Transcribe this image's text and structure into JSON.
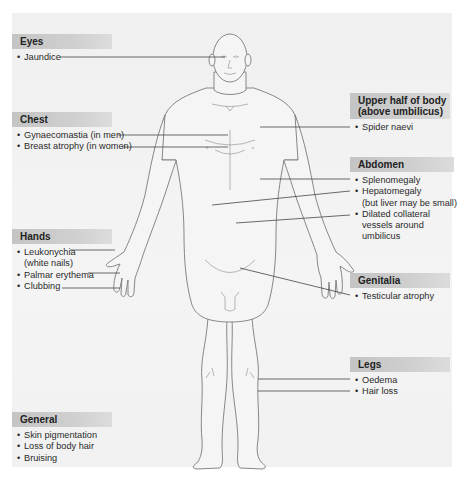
{
  "diagram": {
    "colors": {
      "panel": "#f2f2f2",
      "header_bar": "#c8c8c8",
      "skin": "#f4f4f4",
      "outline": "#777777",
      "leader": "#444444"
    },
    "groups": {
      "eyes": {
        "title": "Eyes",
        "items": [
          {
            "text": "Jaundice"
          }
        ]
      },
      "chest": {
        "title": "Chest",
        "items": [
          {
            "text": "Gynaecomastia (in men)"
          },
          {
            "text": "Breast atrophy (in women)"
          }
        ]
      },
      "hands": {
        "title": "Hands",
        "items": [
          {
            "text": "Leukonychia",
            "sub": "(white nails)"
          },
          {
            "text": "Palmar erythema"
          },
          {
            "text": "Clubbing"
          }
        ]
      },
      "general": {
        "title": "General",
        "items": [
          {
            "text": "Skin pigmentation"
          },
          {
            "text": "Loss of body hair"
          },
          {
            "text": "Bruising"
          }
        ]
      },
      "upper_body": {
        "title_line1": "Upper half of body",
        "title_line2": "(above umbilicus)",
        "items": [
          {
            "text": "Spider naevi"
          }
        ]
      },
      "abdomen": {
        "title": "Abdomen",
        "items": [
          {
            "text": "Splenomegaly"
          },
          {
            "text": "Hepatomegaly",
            "sub": "(but liver may be small)"
          },
          {
            "text": "Dilated collateral",
            "sub": "vessels around",
            "sub2": "umbilicus"
          }
        ]
      },
      "genitalia": {
        "title": "Genitalia",
        "items": [
          {
            "text": "Testicular atrophy"
          }
        ]
      },
      "legs": {
        "title": "Legs",
        "items": [
          {
            "text": "Oedema"
          },
          {
            "text": "Hair loss"
          }
        ]
      }
    },
    "bullet": "•"
  }
}
